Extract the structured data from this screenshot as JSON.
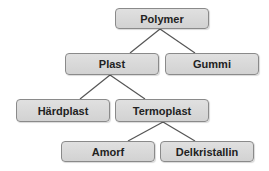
{
  "diagram": {
    "type": "tree",
    "colors": {
      "box_fill": "#d8d8d8",
      "box_border": "#8a8a8a",
      "text": "#222222",
      "line": "#555555"
    },
    "nodes": {
      "polymer": {
        "label": "Polymer"
      },
      "plast": {
        "label": "Plast"
      },
      "gummi": {
        "label": "Gummi"
      },
      "hardplast": {
        "label": "Härdplast"
      },
      "termoplast": {
        "label": "Termoplast"
      },
      "amorf": {
        "label": "Amorf"
      },
      "delkristallin": {
        "label": "Delkristallin"
      }
    },
    "edges": [
      [
        "Polymer",
        "Plast"
      ],
      [
        "Polymer",
        "Gummi"
      ],
      [
        "Plast",
        "Härdplast"
      ],
      [
        "Plast",
        "Termoplast"
      ],
      [
        "Termoplast",
        "Amorf"
      ],
      [
        "Termoplast",
        "Delkristallin"
      ]
    ]
  }
}
